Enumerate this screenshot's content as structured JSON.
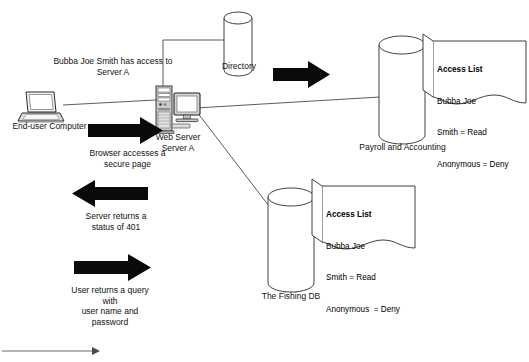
{
  "diagram": {
    "background_color": "#ffffff",
    "line_color": "#3a3a3a",
    "arrow_fill": "#0a0a0a"
  },
  "nodes": {
    "end_user_computer": {
      "label": "End-user Computer",
      "icon": "laptop-icon"
    },
    "web_server": {
      "label_line1": "Web Server",
      "label_line2": "Server A",
      "icon_tower": "server-tower-icon",
      "icon_monitor": "monitor-icon"
    },
    "directory": {
      "label": "Directory",
      "icon": "database-cylinder-icon"
    },
    "payroll": {
      "label": "Payroll and Accounting",
      "icon": "database-cylinder-icon"
    },
    "fishing_db": {
      "label": "The Fishing DB",
      "icon": "database-cylinder-icon"
    }
  },
  "annotations": {
    "access_note_line1": "Bubba Joe Smith has access to",
    "access_note_line2": "Server A",
    "browser_arrow_line1": "Browser accesses a",
    "browser_arrow_line2": "secure page",
    "status_arrow_line1": "Server returns a",
    "status_arrow_line2": "status of 401",
    "query_arrow_line1": "User returns a query",
    "query_arrow_line2": "with",
    "query_arrow_line3": "user name and",
    "query_arrow_line4": "password"
  },
  "access_lists": [
    {
      "id": "payroll-access-list",
      "heading": "Access List",
      "entries": [
        "Bubba Joe",
        "Smith = Read",
        "Anonymous = Deny"
      ]
    },
    {
      "id": "fishing-access-list",
      "heading": "Access List",
      "entries": [
        "Bubba Joe",
        "Smith = Read",
        "Anonymous  = Deny"
      ]
    }
  ],
  "arrows": [
    {
      "name": "browser-request-arrow",
      "direction": "right",
      "style": "block"
    },
    {
      "name": "directory-lookup-arrow",
      "direction": "right",
      "style": "block"
    },
    {
      "name": "status-401-arrow",
      "direction": "left",
      "style": "block"
    },
    {
      "name": "credentials-arrow",
      "direction": "right",
      "style": "block"
    },
    {
      "name": "timeline-arrow",
      "direction": "right",
      "style": "thin"
    }
  ]
}
